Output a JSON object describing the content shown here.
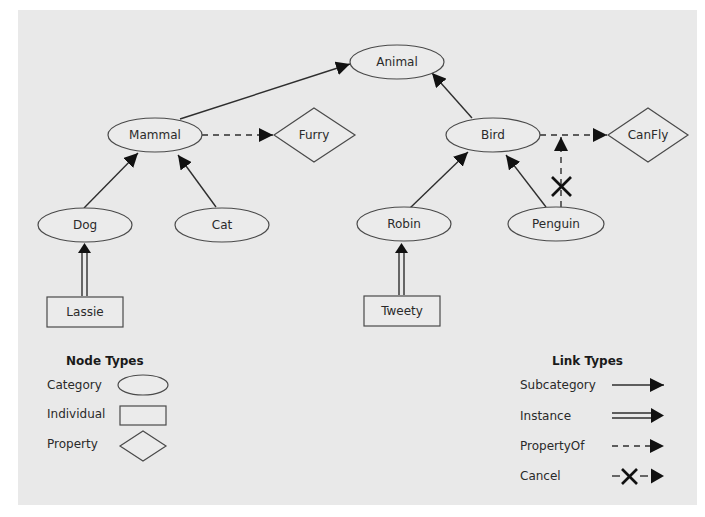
{
  "diagram": {
    "background": "#e9e9e9",
    "nodes": [
      {
        "id": "animal",
        "label": "Animal",
        "type": "Category"
      },
      {
        "id": "mammal",
        "label": "Mammal",
        "type": "Category"
      },
      {
        "id": "bird",
        "label": "Bird",
        "type": "Category"
      },
      {
        "id": "dog",
        "label": "Dog",
        "type": "Category"
      },
      {
        "id": "cat",
        "label": "Cat",
        "type": "Category"
      },
      {
        "id": "robin",
        "label": "Robin",
        "type": "Category"
      },
      {
        "id": "penguin",
        "label": "Penguin",
        "type": "Category"
      },
      {
        "id": "lassie",
        "label": "Lassie",
        "type": "Individual"
      },
      {
        "id": "tweety",
        "label": "Tweety",
        "type": "Individual"
      },
      {
        "id": "furry",
        "label": "Furry",
        "type": "Property"
      },
      {
        "id": "canfly",
        "label": "CanFly",
        "type": "Property"
      }
    ],
    "edges": [
      {
        "from": "Mammal",
        "to": "Animal",
        "type": "Subcategory"
      },
      {
        "from": "Bird",
        "to": "Animal",
        "type": "Subcategory"
      },
      {
        "from": "Dog",
        "to": "Mammal",
        "type": "Subcategory"
      },
      {
        "from": "Cat",
        "to": "Mammal",
        "type": "Subcategory"
      },
      {
        "from": "Robin",
        "to": "Bird",
        "type": "Subcategory"
      },
      {
        "from": "Penguin",
        "to": "Bird",
        "type": "Subcategory"
      },
      {
        "from": "Lassie",
        "to": "Dog",
        "type": "Instance"
      },
      {
        "from": "Tweety",
        "to": "Robin",
        "type": "Instance"
      },
      {
        "from": "Mammal",
        "to": "Furry",
        "type": "PropertyOf"
      },
      {
        "from": "Bird",
        "to": "CanFly",
        "type": "PropertyOf"
      },
      {
        "from": "Penguin",
        "to": "Bird-CanFly link",
        "type": "Cancel"
      }
    ]
  },
  "labels": {
    "animal": "Animal",
    "mammal": "Mammal",
    "bird": "Bird",
    "furry": "Furry",
    "canfly": "CanFly",
    "dog": "Dog",
    "cat": "Cat",
    "robin": "Robin",
    "penguin": "Penguin",
    "lassie": "Lassie",
    "tweety": "Tweety"
  },
  "legend_nodes": {
    "title": "Node Types",
    "items": [
      {
        "label": "Category",
        "shape": "ellipse"
      },
      {
        "label": "Individual",
        "shape": "rectangle"
      },
      {
        "label": "Property",
        "shape": "diamond"
      }
    ]
  },
  "legend_links": {
    "title": "Link Types",
    "items": [
      {
        "label": "Subcategory",
        "style": "solid-arrow"
      },
      {
        "label": "Instance",
        "style": "double-line-arrow"
      },
      {
        "label": "PropertyOf",
        "style": "dashed-arrow"
      },
      {
        "label": "Cancel",
        "style": "dashed-cross-arrow"
      }
    ]
  }
}
